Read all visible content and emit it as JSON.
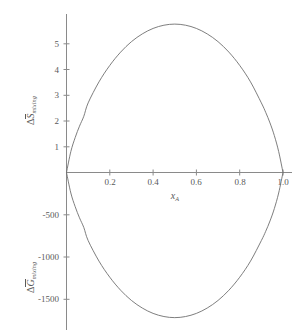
{
  "figure": {
    "background_color": "#ffffff",
    "curve_color": "#6f6f6f",
    "axis_color": "#8a8a8a",
    "text_color": "#5a5a5a"
  },
  "chart_data": {
    "type": "line",
    "title": "",
    "subtitle": "",
    "xlabel": "x_A",
    "xlabel_parts": {
      "symbol": "x",
      "subscript": "A"
    },
    "grid": false,
    "legend": "none",
    "xlim": [
      0,
      1.0
    ],
    "xticks": [
      0.2,
      0.4,
      0.6,
      0.8,
      1.0
    ],
    "xticklabels": [
      "0.2",
      "0.4",
      "0.6",
      "0.8",
      "1.0"
    ],
    "panels": [
      {
        "name": "entropy-of-mixing",
        "ylabel": "ΔS̄_mixing",
        "ylabel_parts": {
          "delta": "Δ",
          "symbol": "S",
          "overbar": true,
          "subscript": "mixing"
        },
        "yticks": [
          1,
          2,
          3,
          4,
          5
        ],
        "yticklabels": [
          "1",
          "2",
          "3",
          "4",
          "5"
        ],
        "ylim": [
          0,
          6.2
        ],
        "peak_x": 0.5,
        "peak_y": 5.763,
        "equation": "-R[x ln x + (1-x) ln(1-x)]",
        "x": [
          0.0,
          0.02,
          0.04,
          0.06,
          0.08,
          0.1,
          0.15,
          0.2,
          0.25,
          0.3,
          0.35,
          0.4,
          0.45,
          0.5,
          0.55,
          0.6,
          0.65,
          0.7,
          0.75,
          0.8,
          0.85,
          0.9,
          0.92,
          0.94,
          0.96,
          0.98,
          1.0
        ],
        "y": [
          0.0,
          0.814,
          1.355,
          1.799,
          2.184,
          2.703,
          3.519,
          4.159,
          4.675,
          5.081,
          5.382,
          5.595,
          5.72,
          5.763,
          5.72,
          5.595,
          5.382,
          5.081,
          4.675,
          4.159,
          3.519,
          2.703,
          2.337,
          1.924,
          1.433,
          0.814,
          0.0
        ]
      },
      {
        "name": "gibbs-free-energy-of-mixing",
        "ylabel": "ΔḠ_mixing",
        "ylabel_parts": {
          "delta": "Δ",
          "symbol": "G",
          "overbar": true,
          "subscript": "mixing"
        },
        "yticks": [
          -500,
          -1000,
          -1500
        ],
        "yticklabels": [
          "-500",
          "-1000",
          "-1500"
        ],
        "ylim": [
          -1850,
          0
        ],
        "min_x": 0.5,
        "min_y": -1717.5,
        "equation": "RT[x ln x + (1-x) ln(1-x)]",
        "x": [
          0.0,
          0.02,
          0.04,
          0.06,
          0.08,
          0.1,
          0.15,
          0.2,
          0.25,
          0.3,
          0.35,
          0.4,
          0.45,
          0.5,
          0.55,
          0.6,
          0.65,
          0.7,
          0.75,
          0.8,
          0.85,
          0.9,
          0.92,
          0.94,
          0.96,
          0.98,
          1.0
        ],
        "y": [
          0.0,
          -242.6,
          -403.8,
          -536.2,
          -651.0,
          -805.6,
          -1048.7,
          -1239.4,
          -1393.1,
          -1514.2,
          -1603.9,
          -1667.4,
          -1704.6,
          -1717.5,
          -1704.6,
          -1667.4,
          -1603.9,
          -1514.2,
          -1393.1,
          -1239.4,
          -1048.7,
          -805.6,
          -696.5,
          -573.4,
          -427.1,
          -242.6,
          0.0
        ]
      }
    ]
  }
}
